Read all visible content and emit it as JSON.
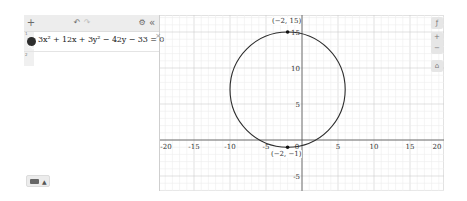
{
  "toolbar": {
    "add_icon": "+",
    "undo_icon": "↶",
    "redo_icon": "↷",
    "settings_icon": "⚙",
    "collapse_icon": "«"
  },
  "expressions": [
    {
      "index": "1",
      "latex_display": "3x² + 12x + 3y² − 42y − 33 = 0",
      "color": "#2d2d2d",
      "close_icon": "×"
    }
  ],
  "empty_row_index": "2",
  "keyboard": {
    "caret": "▲"
  },
  "graph_controls": {
    "wrench_icon": "🔧",
    "zoom_in": "+",
    "zoom_out": "−",
    "home_icon": "⌂"
  },
  "graph": {
    "x_ticks": [
      "-20",
      "-15",
      "-10",
      "-5",
      "0",
      "5",
      "10",
      "15",
      "20"
    ],
    "y_ticks": [
      "15",
      "10",
      "5",
      "-5"
    ],
    "x_range": [
      -19.7,
      19.7
    ],
    "y_range": [
      -7.1,
      17.4
    ],
    "curve": {
      "type": "circle",
      "center": [
        -2,
        7
      ],
      "radius": 8,
      "color": "#2d2d2d"
    },
    "points": [
      {
        "label": "(−2, 15)",
        "x": -2,
        "y": 15
      },
      {
        "label": "(−2, −1)",
        "x": -2,
        "y": -1
      }
    ]
  }
}
